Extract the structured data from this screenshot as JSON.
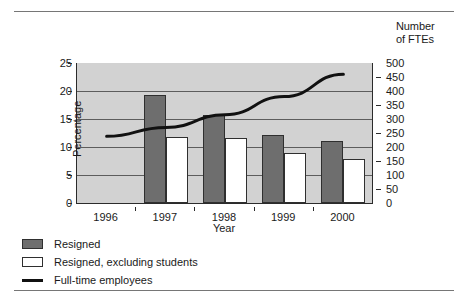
{
  "chart_data": {
    "type": "bar",
    "title": "",
    "xlabel": "Year",
    "ylabel": "Percentage",
    "y2label": "Number of FTEs",
    "y2label_lines": [
      "Number",
      "of FTEs"
    ],
    "categories": [
      "1996",
      "1997",
      "1998",
      "1999",
      "2000"
    ],
    "ylim": [
      0,
      25
    ],
    "yticks": [
      0,
      5,
      10,
      15,
      20,
      25
    ],
    "y2lim": [
      0,
      500
    ],
    "y2ticks": [
      0,
      50,
      100,
      150,
      200,
      250,
      300,
      350,
      400,
      450,
      500
    ],
    "gridlines": [
      5,
      10,
      15,
      20
    ],
    "grid": true,
    "legend_position": "below-left",
    "series": [
      {
        "name": "Resigned",
        "type": "bar",
        "axis": "left",
        "color": "#6e6e6e",
        "values": [
          null,
          19.3,
          15.8,
          12.1,
          11.0
        ]
      },
      {
        "name": "Resigned, excluding students",
        "type": "bar",
        "axis": "left",
        "color": "#ffffff",
        "values": [
          null,
          11.7,
          11.6,
          9.0,
          7.9
        ]
      },
      {
        "name": "Full-time employees",
        "type": "line",
        "axis": "right",
        "color": "#111111",
        "values": [
          238,
          270,
          315,
          380,
          460
        ]
      }
    ]
  },
  "axes": {
    "left": {
      "title": "Percentage",
      "ticks": [
        "0",
        "5",
        "10",
        "15",
        "20",
        "25"
      ]
    },
    "right": {
      "title_line1": "Number",
      "title_line2": "of FTEs",
      "ticks": [
        "0",
        "50",
        "100",
        "150",
        "200",
        "250",
        "300",
        "350",
        "400",
        "450",
        "500"
      ]
    },
    "bottom": {
      "title": "Year",
      "ticks": [
        "1996",
        "1997",
        "1998",
        "1999",
        "2000"
      ]
    }
  },
  "legend": {
    "items": [
      {
        "label": "Resigned",
        "swatch": "dark-square-swatch"
      },
      {
        "label": "Resigned, excluding students",
        "swatch": "white-square-swatch"
      },
      {
        "label": "Full-time employees",
        "swatch": "black-line-swatch"
      }
    ]
  },
  "colors": {
    "plot_background": "#d2d2d2",
    "bar_resigned": "#6e6e6e",
    "bar_resigned_excluding": "#ffffff",
    "line": "#111111",
    "axis": "#2b2b2b",
    "gridline": "#5d5d5d"
  }
}
